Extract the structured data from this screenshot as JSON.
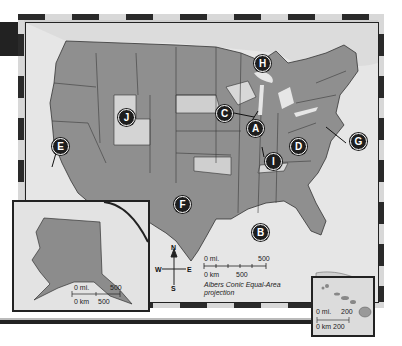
{
  "map": {
    "title": "United States physical-political map",
    "projection": "Albers Conic Equal-Area projection",
    "projection_line1": "Albers Conic Equal-Area",
    "projection_line2": "projection",
    "markers": [
      {
        "label": "A",
        "region": "Illinois / Lake Michigan area"
      },
      {
        "label": "B",
        "region": "Gulf of Mexico"
      },
      {
        "label": "C",
        "region": "Iowa"
      },
      {
        "label": "D",
        "region": "Kentucky / Virginia area"
      },
      {
        "label": "E",
        "region": "California coast"
      },
      {
        "label": "F",
        "region": "Texas"
      },
      {
        "label": "G",
        "region": "Chesapeake / Maryland area"
      },
      {
        "label": "H",
        "region": "Michigan Upper Peninsula"
      },
      {
        "label": "I",
        "region": "Tennessee"
      },
      {
        "label": "J",
        "region": "Utah / Wyoming"
      }
    ],
    "compass": {
      "n": "N",
      "s": "S",
      "e": "E",
      "w": "W"
    },
    "main_scale": {
      "mi_label": "0 mi.",
      "mi_max": "500",
      "km_label": "0 km",
      "km_max": "500"
    },
    "alaska_inset": {
      "mi_label": "0 mi.",
      "mi_max": "500",
      "km_label": "0 km",
      "km_max": "500"
    },
    "hawaii_inset": {
      "mi_label": "0 mi.",
      "mi_max": "200",
      "km_label": "0 km",
      "km_max": "200"
    }
  }
}
